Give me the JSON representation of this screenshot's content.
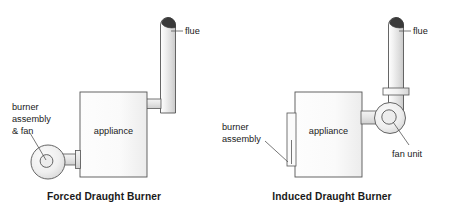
{
  "figure": {
    "title_left": "Forced Draught Burner",
    "title_right": "Induced Draught Burner",
    "background_color": "#ffffff",
    "line_color": "#555555",
    "text_color": "#1a1a1a",
    "body_fill_light": "#f7f7f7",
    "body_fill_shade": "#d9d9d9",
    "flue_cap_color": "#3a3a3a"
  },
  "left_diagram": {
    "name": "forced-draught-burner",
    "caption": "Forced Draught Burner",
    "appliance_label": "appliance",
    "flue_label": "flue",
    "burner_label_line1": "burner",
    "burner_label_line2": "assembly",
    "burner_label_line3": "& fan",
    "components": [
      "flue",
      "appliance",
      "flue-connector-duct",
      "burner-duct",
      "burner-fan-housing",
      "fan-hub"
    ]
  },
  "right_diagram": {
    "name": "induced-draught-burner",
    "caption": "Induced Draught Burner",
    "appliance_label": "appliance",
    "flue_label": "flue",
    "burner_label_line1": "burner",
    "burner_label_line2": "assembly",
    "fan_label": "fan unit",
    "components": [
      "flue",
      "flue-collar",
      "appliance",
      "burner-assembly-plate",
      "fan-duct",
      "fan-unit-housing",
      "fan-hub"
    ]
  }
}
